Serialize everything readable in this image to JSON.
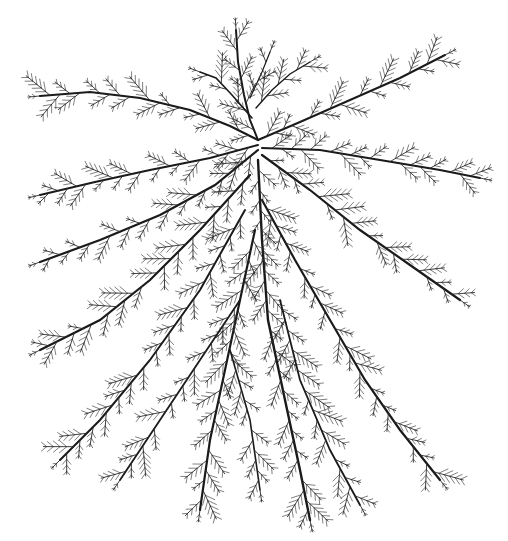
{
  "image": {
    "width": 508,
    "height": 541,
    "background": "#ffffff",
    "ink_color": "#1a1a1a",
    "subject": "dendritic branching ink drawing",
    "hub": [
      258,
      140
    ],
    "branches": [
      {
        "pts": [
          [
            258,
            140
          ],
          [
            250,
            120
          ],
          [
            244,
            95
          ],
          [
            238,
            62
          ],
          [
            236,
            30
          ]
        ],
        "w": 2.0
      },
      {
        "pts": [
          [
            252,
            118
          ],
          [
            232,
            95
          ],
          [
            216,
            78
          ],
          [
            200,
            72
          ]
        ],
        "w": 1.6
      },
      {
        "pts": [
          [
            256,
            108
          ],
          [
            272,
            90
          ],
          [
            290,
            74
          ],
          [
            310,
            62
          ]
        ],
        "w": 1.4
      },
      {
        "pts": [
          [
            250,
            98
          ],
          [
            262,
            72
          ],
          [
            270,
            52
          ]
        ],
        "w": 1.2
      },
      {
        "pts": [
          [
            258,
            140
          ],
          [
            230,
            126
          ],
          [
            190,
            110
          ],
          [
            140,
            98
          ],
          [
            90,
            92
          ],
          [
            40,
            96
          ]
        ],
        "w": 2.2
      },
      {
        "pts": [
          [
            258,
            145
          ],
          [
            210,
            158
          ],
          [
            150,
            170
          ],
          [
            95,
            182
          ],
          [
            40,
            195
          ]
        ],
        "w": 2.0
      },
      {
        "pts": [
          [
            258,
            150
          ],
          [
            215,
            185
          ],
          [
            160,
            215
          ],
          [
            100,
            240
          ],
          [
            40,
            262
          ]
        ],
        "w": 2.2
      },
      {
        "pts": [
          [
            250,
            175
          ],
          [
            200,
            230
          ],
          [
            150,
            280
          ],
          [
            100,
            320
          ],
          [
            40,
            350
          ]
        ],
        "w": 2.2
      },
      {
        "pts": [
          [
            245,
            210
          ],
          [
            200,
            290
          ],
          [
            150,
            360
          ],
          [
            100,
            420
          ],
          [
            60,
            460
          ]
        ],
        "w": 2.0
      },
      {
        "pts": [
          [
            258,
            140
          ],
          [
            300,
            122
          ],
          [
            350,
            100
          ],
          [
            400,
            78
          ],
          [
            445,
            55
          ]
        ],
        "w": 2.0
      },
      {
        "pts": [
          [
            262,
            148
          ],
          [
            320,
            150
          ],
          [
            380,
            160
          ],
          [
            440,
            170
          ],
          [
            480,
            178
          ]
        ],
        "w": 2.0
      },
      {
        "pts": [
          [
            262,
            155
          ],
          [
            310,
            190
          ],
          [
            360,
            230
          ],
          [
            410,
            265
          ],
          [
            460,
            300
          ]
        ],
        "w": 2.2
      },
      {
        "pts": [
          [
            258,
            160
          ],
          [
            262,
            240
          ],
          [
            268,
            320
          ],
          [
            285,
            400
          ],
          [
            300,
            470
          ],
          [
            310,
            520
          ]
        ],
        "w": 2.4
      },
      {
        "pts": [
          [
            262,
            200
          ],
          [
            295,
            260
          ],
          [
            330,
            320
          ],
          [
            365,
            380
          ],
          [
            400,
            430
          ],
          [
            440,
            480
          ]
        ],
        "w": 2.2
      },
      {
        "pts": [
          [
            255,
            230
          ],
          [
            240,
            300
          ],
          [
            225,
            370
          ],
          [
            210,
            440
          ],
          [
            200,
            510
          ]
        ],
        "w": 2.2
      },
      {
        "pts": [
          [
            240,
            300
          ],
          [
            200,
            360
          ],
          [
            160,
            420
          ],
          [
            120,
            480
          ]
        ],
        "w": 1.8
      },
      {
        "pts": [
          [
            280,
            300
          ],
          [
            300,
            380
          ],
          [
            330,
            450
          ],
          [
            360,
            505
          ]
        ],
        "w": 1.8
      },
      {
        "pts": [
          [
            230,
            350
          ],
          [
            250,
            420
          ],
          [
            260,
            490
          ]
        ],
        "w": 1.6
      }
    ],
    "sprig_spacing": 11,
    "sprig_length": 9
  }
}
